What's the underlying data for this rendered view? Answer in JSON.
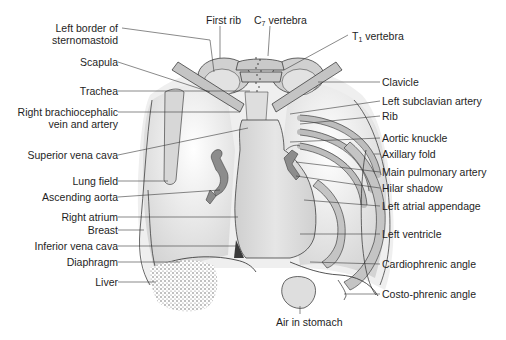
{
  "figure": {
    "colors": {
      "background": "#ffffff",
      "line": "#2a2a2a",
      "bone": "#c8c8c8",
      "soft_tissue": "#dcdcdc",
      "heart": "#d2d2d2",
      "vessels": "#8c8c8c",
      "label_text": "#1e1e1e"
    }
  },
  "labels": {
    "left": [
      {
        "id": "left-border-sternomastoid",
        "text_line1": "Left border of",
        "text_line2": "sternomastoid"
      },
      {
        "id": "scapula",
        "text": "Scapula"
      },
      {
        "id": "trachea",
        "text": "Trachea"
      },
      {
        "id": "right-brachiocephalic",
        "text_line1": "Right brachiocephalic",
        "text_line2": "vein and artery"
      },
      {
        "id": "superior-vena-cava",
        "text": "Superior vena cava"
      },
      {
        "id": "lung-field",
        "text": "Lung field"
      },
      {
        "id": "ascending-aorta",
        "text": "Ascending aorta"
      },
      {
        "id": "right-atrium",
        "text": "Right atrium"
      },
      {
        "id": "breast",
        "text": "Breast"
      },
      {
        "id": "inferior-vena-cava",
        "text": "Inferior vena cava"
      },
      {
        "id": "diaphragm",
        "text": "Diaphragm"
      },
      {
        "id": "liver",
        "text": "Liver"
      }
    ],
    "top": [
      {
        "id": "first-rib",
        "text": "First rib"
      },
      {
        "id": "c7-vertebra",
        "prefix": "C",
        "sub": "7",
        "suffix": " vertebra"
      },
      {
        "id": "t1-vertebra",
        "prefix": "T",
        "sub": "1",
        "suffix": " vertebra"
      }
    ],
    "right": [
      {
        "id": "clavicle",
        "text": "Clavicle"
      },
      {
        "id": "left-subclavian-artery",
        "text": "Left subclavian artery"
      },
      {
        "id": "rib",
        "text": "Rib"
      },
      {
        "id": "aortic-knuckle",
        "text": "Aortic knuckle"
      },
      {
        "id": "axillary-fold",
        "text": "Axillary fold"
      },
      {
        "id": "main-pulmonary-artery",
        "text": "Main pulmonary artery"
      },
      {
        "id": "hilar-shadow",
        "text": "Hilar shadow"
      },
      {
        "id": "left-atrial-appendage",
        "text": "Left atrial appendage"
      },
      {
        "id": "left-ventricle",
        "text": "Left ventricle"
      },
      {
        "id": "cardiophrenic-angle",
        "text": "Cardiophrenic angle"
      },
      {
        "id": "costo-phrenic-angle",
        "text": "Costo-phrenic angle"
      }
    ],
    "bottom": [
      {
        "id": "air-in-stomach",
        "text": "Air in stomach"
      }
    ]
  }
}
